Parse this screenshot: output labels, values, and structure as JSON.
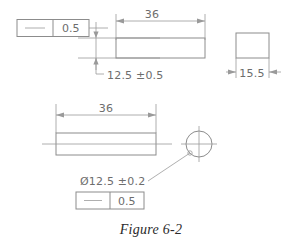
{
  "figure": {
    "caption": "Figure 6-2"
  },
  "top_view": {
    "feature_control_frame": {
      "symbol_name": "straightness-symbol",
      "symbol_glyph": "—",
      "tolerance": "0.5"
    },
    "length_dimension": "36",
    "height_dimension": "12.5  ±0.5",
    "side_view_width_dimension": "15.5"
  },
  "bottom_view": {
    "length_dimension": "36",
    "diameter_dimension": "Ø12.5  ±0.2",
    "feature_control_frame": {
      "symbol_name": "straightness-symbol",
      "symbol_glyph": "—",
      "tolerance": "0.5"
    }
  },
  "colors": {
    "background": "#ffffff",
    "line": "#8c8c8c",
    "thin_line": "#9a9a9a",
    "text": "#6d6d6d",
    "caption_text": "#2b2b2b"
  }
}
